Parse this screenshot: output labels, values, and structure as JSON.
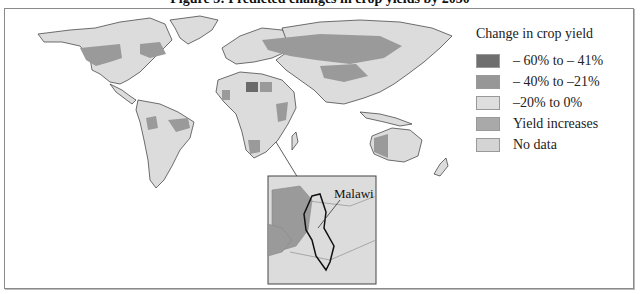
{
  "figure": {
    "title": "Figure 3: Predicted changes in crop yields by 2050"
  },
  "legend": {
    "title": "Change in crop yield",
    "items": [
      {
        "label": "– 60% to – 41%",
        "color": "#6f6f6f"
      },
      {
        "label": "– 40% to  –21%",
        "color": "#979797"
      },
      {
        "label": "–20% to 0%",
        "color": "#dedede"
      },
      {
        "label": "Yield increases",
        "color": "#a9a9a9"
      },
      {
        "label": "No data",
        "color": "#d4d4d4"
      }
    ]
  },
  "inset": {
    "label": "Malawi"
  },
  "colors": {
    "land": "#dcdcdc",
    "decline_mid": "#9a9a9a",
    "decline_high": "#6a6a6a",
    "increase": "#a8a8a8",
    "border": "#333333"
  }
}
